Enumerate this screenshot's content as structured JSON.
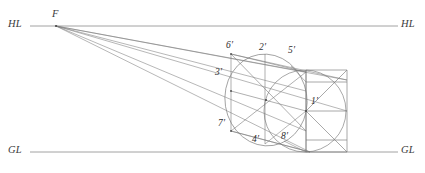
{
  "figure": {
    "stroke_color": "#7a7a7a",
    "axis_color": "#8c8c8c",
    "label_color": "#2e2e2e",
    "background": "#ffffff",
    "axes": [
      {
        "name": "horizon-line",
        "label": "HL",
        "y": 26,
        "x_start": 30,
        "x_end": 398
      },
      {
        "name": "ground-line",
        "label": "GL",
        "y": 152,
        "x_start": 30,
        "x_end": 398
      }
    ],
    "axis_labels": [
      {
        "name": "hl-label-left",
        "text": "HL",
        "x": 8,
        "y": 21
      },
      {
        "name": "hl-label-right",
        "text": "HL",
        "x": 402,
        "y": 21
      },
      {
        "name": "gl-label-left",
        "text": "GL",
        "x": 8,
        "y": 147
      },
      {
        "name": "gl-label-right",
        "text": "GL",
        "x": 402,
        "y": 147
      }
    ],
    "vanishing_point": {
      "name": "vanishing-point-F",
      "label": "F",
      "x": 56,
      "y": 26,
      "label_x": 52,
      "label_y": 11
    },
    "point_labels": [
      {
        "name": "point-label-6p",
        "text": "6′",
        "x": 226,
        "y": 43
      },
      {
        "name": "point-label-2p",
        "text": "2′",
        "x": 259,
        "y": 45
      },
      {
        "name": "point-label-5p",
        "text": "5′",
        "x": 288,
        "y": 48
      },
      {
        "name": "point-label-3p",
        "text": "3′",
        "x": 216,
        "y": 70
      },
      {
        "name": "point-label-1p",
        "text": "1′",
        "x": 311,
        "y": 99
      },
      {
        "name": "point-label-7p",
        "text": "7′",
        "x": 219,
        "y": 121
      },
      {
        "name": "point-label-4p",
        "text": "4′",
        "x": 252,
        "y": 137
      },
      {
        "name": "point-label-8p",
        "text": "8′",
        "x": 281,
        "y": 134
      }
    ],
    "ellipse": {
      "name": "perspective-ellipse",
      "cx": 265,
      "cy": 99,
      "rx": 41,
      "ry": 45
    },
    "circle": {
      "name": "true-circle",
      "cx": 305,
      "cy": 111,
      "r": 41
    },
    "counts": {
      "vanishing_rays": 6,
      "labeled_points": 8
    }
  }
}
